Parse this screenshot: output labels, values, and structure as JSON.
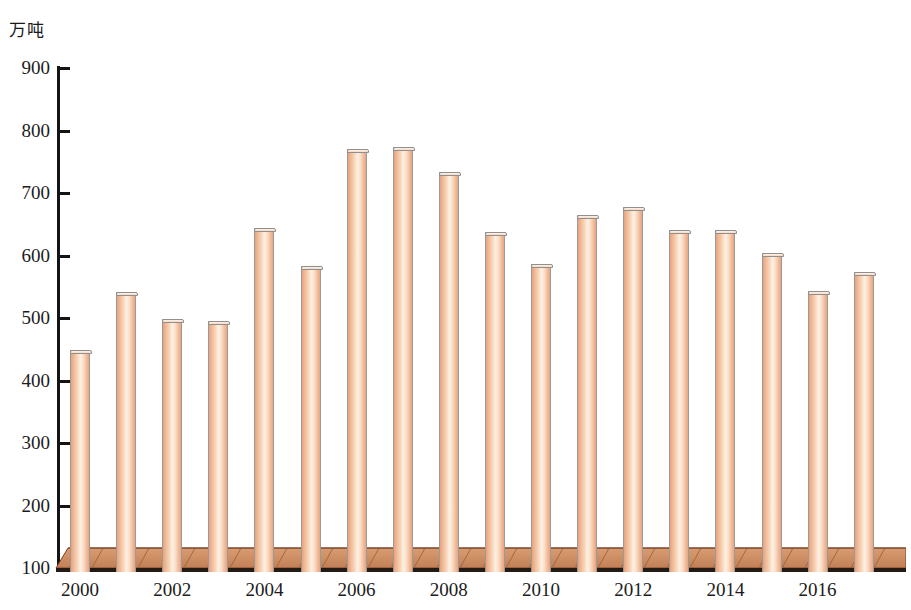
{
  "chart_data": {
    "type": "bar",
    "title": "",
    "subtitle": "",
    "xlabel": "",
    "ylabel": "万吨",
    "unit_label": "万吨",
    "categories": [
      "2000",
      "2001",
      "2002",
      "2003",
      "2004",
      "2005",
      "2006",
      "2007",
      "2008",
      "2009",
      "2010",
      "2011",
      "2012",
      "2013",
      "2014",
      "2015",
      "2016",
      "2017"
    ],
    "values": [
      449,
      541,
      498,
      495,
      644,
      583,
      770,
      773,
      733,
      637,
      586,
      665,
      678,
      641,
      641,
      604,
      544,
      573
    ],
    "x_tick_labels": [
      "2000",
      "2002",
      "2004",
      "2006",
      "2008",
      "2010",
      "2012",
      "2014",
      "2016"
    ],
    "y_ticks": [
      100,
      200,
      300,
      400,
      500,
      600,
      700,
      800,
      900
    ],
    "ylim": [
      100,
      900
    ],
    "grid": false,
    "legend": null,
    "legend_position": "none",
    "series": [
      {
        "name": "",
        "values": [
          449,
          541,
          498,
          495,
          644,
          583,
          770,
          773,
          733,
          637,
          586,
          665,
          678,
          641,
          641,
          604,
          544,
          573
        ]
      }
    ]
  },
  "style": {
    "bar_fill_light": "#fdf0e2",
    "bar_fill_mid": "#f7d3b6",
    "bar_fill_edge": "#e8a27c",
    "bar_border": "#9a9a9a",
    "platform_fill": "#cd8d63",
    "platform_line": "#8a4f2d",
    "axis_color": "#141414",
    "text_color": "#1c1c1c"
  }
}
